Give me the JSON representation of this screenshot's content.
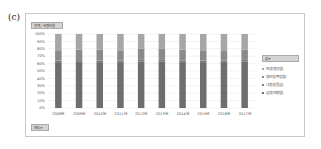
{
  "panel_label": "(c)",
  "title_field_button": "합계 / 유량비율",
  "year_field_button": "연도 ▾",
  "legend_filter_label": "값 ▾",
  "chart_data": {
    "type": "bar",
    "stacked": true,
    "percent_stacked": true,
    "title": "",
    "xlabel": "",
    "ylabel": "",
    "ylim": [
      0,
      100
    ],
    "y_ticks": [
      "0%",
      "10%",
      "20%",
      "30%",
      "40%",
      "50%",
      "60%",
      "70%",
      "80%",
      "90%",
      "100%"
    ],
    "grid": true,
    "legend_position": "right",
    "categories": [
      "2008년",
      "2009년",
      "2010년",
      "2011년",
      "2012년",
      "2013년",
      "2014년",
      "2015년",
      "2016년",
      "2017년"
    ],
    "series": [
      {
        "name": "금강(대청댐)",
        "color": "#6e6e6e",
        "values": [
          62,
          63,
          62,
          62,
          63,
          63,
          62,
          62,
          62,
          63
        ]
      },
      {
        "name": "낙동강(물금)",
        "color": "#7d7d7d",
        "values": [
          2,
          2,
          2,
          2,
          2,
          2,
          2,
          2,
          2,
          2
        ]
      },
      {
        "name": "영산강(주암댐)",
        "color": "#8a8a8a",
        "values": [
          13,
          14,
          15,
          14,
          15,
          15,
          15,
          14,
          13,
          14
        ]
      },
      {
        "name": "한강(팔당댐)",
        "color": "#a6a6a6",
        "values": [
          23,
          21,
          21,
          22,
          20,
          20,
          21,
          22,
          23,
          21
        ]
      }
    ]
  }
}
